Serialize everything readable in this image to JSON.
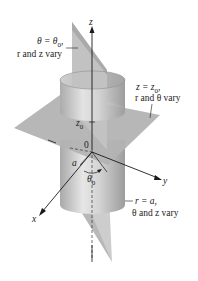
{
  "axes": {
    "z_label": "z",
    "x_label": "x",
    "y_label": "y",
    "origin_label": "0",
    "z0_label": "z",
    "z0_sub": "0",
    "radius_label": "a",
    "angle_label": "θ",
    "angle_sub": "0"
  },
  "annotations": {
    "theta_plane": {
      "line1": "θ = θ",
      "line1_sub": "0",
      "line1_tail": ",",
      "line2": "r and z vary"
    },
    "z_plane": {
      "line1": "z = z",
      "line1_sub": "0",
      "line1_tail": ",",
      "line2": "r and θ vary"
    },
    "cylinder": {
      "line1": "r = a,",
      "line2": "θ and z vary"
    }
  },
  "colors": {
    "plane": "#b0b0b0",
    "plane_dark": "#9a9a9a",
    "cylinder_light": "#e8e8e8",
    "cylinder_mid": "#c4c4c4",
    "cylinder_dark": "#a8a8a8",
    "axis": "#1a1a1a"
  }
}
